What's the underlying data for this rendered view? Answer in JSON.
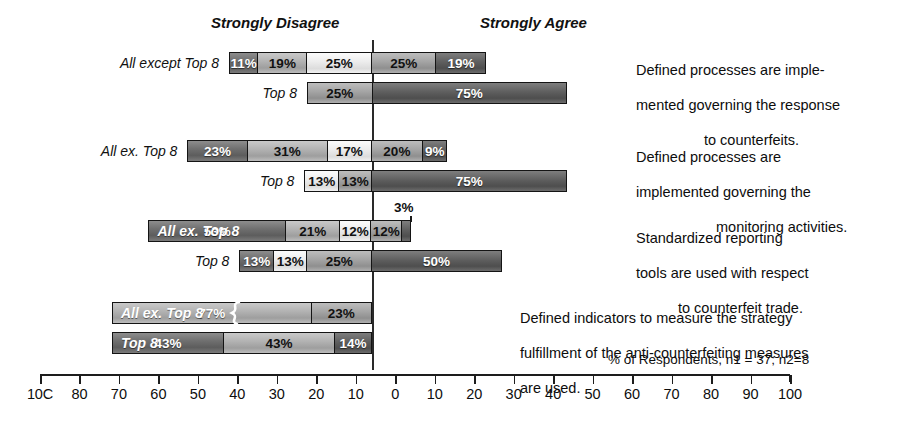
{
  "headers": {
    "left": "Strongly Disagree",
    "right": "Strongly Agree"
  },
  "note": "% of Respondents, n1 = 37; n2=8",
  "labels": {
    "all_long": "All except Top 8",
    "all_short": "All ex. Top 8",
    "top8": "Top 8"
  },
  "captions": {
    "c1_l1": "Defined processes are imple-",
    "c1_l2": "mented governing the response",
    "c1_l3": "to counterfeits.",
    "c2_l1": "Defined processes are",
    "c2_l2": "implemented governing the",
    "c2_l3": "monitoring activities.",
    "c3_l1": "Standardized reporting",
    "c3_l2": "tools are used with respect",
    "c3_l3": "to counterfeit trade.",
    "c4_l1": "Defined indicators to measure the strategy",
    "c4_l2": "fulfillment of the anti-counterfeiting measures",
    "c4_l3": "are used."
  },
  "axis": {
    "ticks": [
      "100",
      "80",
      "70",
      "60",
      "50",
      "40",
      "30",
      "20",
      "10",
      "0",
      "10",
      "20",
      "30",
      "40",
      "50",
      "60",
      "70",
      "80",
      "90",
      "100"
    ],
    "first_label_rendered": "10C",
    "min": -100,
    "max": 100,
    "zero_label": "0"
  },
  "chart_data": {
    "type": "bar",
    "subtype": "diverging-stacked",
    "title": "",
    "xlabel": "% of Respondents, n1 = 37; n2=8",
    "ylabel": "",
    "xlim": [
      -100,
      100
    ],
    "grid": false,
    "legend_position": "none",
    "scale_headers": [
      "Strongly Disagree",
      "Strongly Agree"
    ],
    "groups": [
      {
        "question": "Defined processes are implemented governing the response to counterfeits.",
        "series": [
          {
            "name": "All except Top 8",
            "n": 37,
            "negative": [
              11,
              19
            ],
            "neutral": 25,
            "positive": [
              25,
              19
            ],
            "segments": [
              {
                "value": 11,
                "label": "11%",
                "side": "negative",
                "fill": "f1",
                "text": "light"
              },
              {
                "value": 19,
                "label": "19%",
                "side": "negative",
                "fill": "f2",
                "text": "dark"
              },
              {
                "value": 25,
                "label": "25%",
                "side": "neutral",
                "fill": "f3",
                "text": "dark"
              },
              {
                "value": 25,
                "label": "25%",
                "side": "positive",
                "fill": "f4",
                "text": "dark"
              },
              {
                "value": 19,
                "label": "19%",
                "side": "positive",
                "fill": "f5",
                "text": "light"
              }
            ]
          },
          {
            "name": "Top 8",
            "n": 8,
            "negative": [],
            "neutral": 25,
            "positive": [
              75
            ],
            "segments": [
              {
                "value": 25,
                "label": "25%",
                "side": "neutral",
                "fill": "f4",
                "text": "dark"
              },
              {
                "value": 75,
                "label": "75%",
                "side": "positive",
                "fill": "f5",
                "text": "light"
              }
            ]
          }
        ]
      },
      {
        "question": "Defined processes are implemented governing the monitoring activities.",
        "series": [
          {
            "name": "All ex. Top 8",
            "n": 37,
            "negative": [
              23,
              31
            ],
            "neutral": 17,
            "positive": [
              20,
              9
            ],
            "segments": [
              {
                "value": 23,
                "label": "23%",
                "side": "negative",
                "fill": "f1",
                "text": "light"
              },
              {
                "value": 31,
                "label": "31%",
                "side": "negative",
                "fill": "f2",
                "text": "dark"
              },
              {
                "value": 17,
                "label": "17%",
                "side": "neutral",
                "fill": "f3",
                "text": "dark"
              },
              {
                "value": 20,
                "label": "20%",
                "side": "positive",
                "fill": "f4",
                "text": "dark"
              },
              {
                "value": 9,
                "label": "9%",
                "side": "positive",
                "fill": "f5",
                "text": "light"
              }
            ]
          },
          {
            "name": "Top 8",
            "n": 8,
            "negative": [
              13
            ],
            "neutral": 13,
            "positive": [
              75
            ],
            "segments": [
              {
                "value": 13,
                "label": "13%",
                "side": "negative",
                "fill": "f3",
                "text": "dark"
              },
              {
                "value": 13,
                "label": "13%",
                "side": "neutral",
                "fill": "f4",
                "text": "dark"
              },
              {
                "value": 75,
                "label": "75%",
                "side": "positive",
                "fill": "f5",
                "text": "light"
              }
            ]
          }
        ]
      },
      {
        "question": "Standardized reporting tools are used with respect to counterfeit trade.",
        "series": [
          {
            "name": "All ex. Top 8",
            "n": 37,
            "negative": [
              53,
              21
            ],
            "neutral": 12,
            "positive": [
              12,
              3
            ],
            "label_inside": true,
            "segments": [
              {
                "value": 53,
                "label": "53%",
                "side": "negative",
                "fill": "f1",
                "text": "light"
              },
              {
                "value": 21,
                "label": "21%",
                "side": "negative",
                "fill": "f2",
                "text": "dark"
              },
              {
                "value": 12,
                "label": "12%",
                "side": "neutral",
                "fill": "f3",
                "text": "dark"
              },
              {
                "value": 12,
                "label": "12%",
                "side": "positive",
                "fill": "f4",
                "text": "dark"
              },
              {
                "value": 3,
                "label": "3%",
                "side": "positive",
                "fill": "f5",
                "text": "callout"
              }
            ]
          },
          {
            "name": "Top 8",
            "n": 8,
            "negative": [
              13
            ],
            "neutral": 13,
            "positive": [
              25,
              50
            ],
            "segments": [
              {
                "value": 13,
                "label": "13%",
                "side": "negative",
                "fill": "f1",
                "text": "light"
              },
              {
                "value": 13,
                "label": "13%",
                "side": "negative",
                "fill": "f3",
                "text": "dark"
              },
              {
                "value": 25,
                "label": "25%",
                "side": "neutral",
                "fill": "f4",
                "text": "dark"
              },
              {
                "value": 50,
                "label": "50%",
                "side": "positive",
                "fill": "f5",
                "text": "light"
              }
            ]
          }
        ]
      },
      {
        "question": "Defined indicators to measure the strategy fulfillment of the anti-counterfeiting measures are used.",
        "series": [
          {
            "name": "All ex. Top 8",
            "n": 37,
            "negative": [
              77,
              23
            ],
            "neutral": 0,
            "positive": [],
            "label_inside": true,
            "has_break_mark": true,
            "segments": [
              {
                "value": 77,
                "label": "77%",
                "side": "negative",
                "fill": "f2",
                "text": "light"
              },
              {
                "value": 23,
                "label": "23%",
                "side": "negative",
                "fill": "f4",
                "text": "dark"
              }
            ]
          },
          {
            "name": "Top 8",
            "n": 8,
            "negative": [
              43,
              43,
              14
            ],
            "neutral": 0,
            "positive": [],
            "label_inside": true,
            "segments": [
              {
                "value": 43,
                "label": "43%",
                "side": "negative",
                "fill": "f1",
                "text": "light"
              },
              {
                "value": 43,
                "label": "43%",
                "side": "negative",
                "fill": "f2",
                "text": "dark"
              },
              {
                "value": 14,
                "label": "14%",
                "side": "negative",
                "fill": "f5",
                "text": "light"
              }
            ]
          }
        ]
      }
    ]
  }
}
